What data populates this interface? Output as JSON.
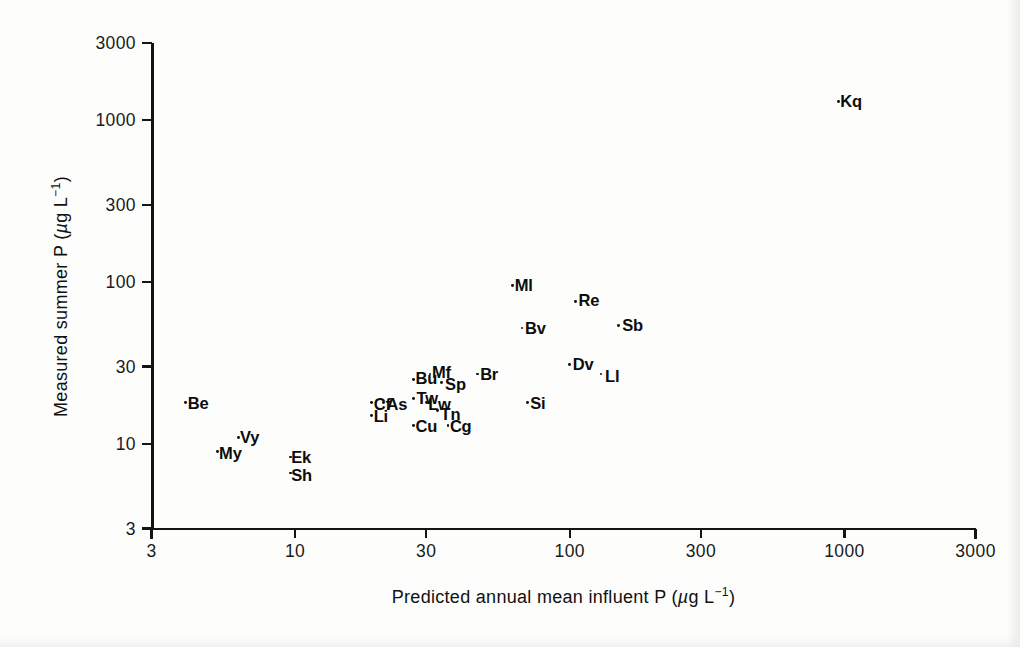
{
  "figure": {
    "background_color": "#fdfdfc",
    "ink_color": "#111111"
  },
  "chart_data": {
    "type": "scatter",
    "title": "",
    "xlabel": "Predicted annual mean influent P (µg L⁻¹)",
    "ylabel": "Measured summer P (µg L⁻¹)",
    "xscale": "log",
    "yscale": "log",
    "xlim": [
      3,
      3000
    ],
    "ylim": [
      3,
      3000
    ],
    "grid": false,
    "legend": null,
    "xticks": [
      3,
      10,
      30,
      100,
      300,
      1000,
      3000
    ],
    "xticklabels": [
      "3",
      "10",
      "30",
      "100",
      "300",
      "1000",
      "3000"
    ],
    "yticks": [
      3,
      10,
      30,
      100,
      300,
      1000,
      3000
    ],
    "yticklabels": [
      "3",
      "10",
      "30",
      "100",
      "300",
      "1000",
      "3000"
    ],
    "point_label_mode": "text-label-per-point",
    "points": [
      {
        "label": "Kq",
        "x": 950,
        "y": 1300
      },
      {
        "label": "Ml",
        "x": 62,
        "y": 95
      },
      {
        "label": "Re",
        "x": 105,
        "y": 76
      },
      {
        "label": "Bv",
        "x": 67,
        "y": 52
      },
      {
        "label": "Sb",
        "x": 150,
        "y": 54
      },
      {
        "label": "Dv",
        "x": 100,
        "y": 31
      },
      {
        "label": "Ll",
        "x": 130,
        "y": 27
      },
      {
        "label": "Br",
        "x": 46,
        "y": 27
      },
      {
        "label": "Bu",
        "x": 27,
        "y": 25
      },
      {
        "label": "Mf",
        "x": 31,
        "y": 27
      },
      {
        "label": "Sp",
        "x": 34,
        "y": 24
      },
      {
        "label": "Si",
        "x": 70,
        "y": 18
      },
      {
        "label": "Cf",
        "x": 19,
        "y": 18
      },
      {
        "label": "As",
        "x": 21,
        "y": 18
      },
      {
        "label": "Tw",
        "x": 27,
        "y": 19
      },
      {
        "label": "Lw",
        "x": 30,
        "y": 18
      },
      {
        "label": "Tn",
        "x": 33,
        "y": 16
      },
      {
        "label": "Li",
        "x": 19,
        "y": 15
      },
      {
        "label": "Be",
        "x": 4.0,
        "y": 18
      },
      {
        "label": "Cu",
        "x": 27,
        "y": 13
      },
      {
        "label": "Cg",
        "x": 36,
        "y": 13
      },
      {
        "label": "Vy",
        "x": 6.2,
        "y": 11
      },
      {
        "label": "My",
        "x": 5.2,
        "y": 9.0
      },
      {
        "label": "Ek",
        "x": 9.6,
        "y": 8.3
      },
      {
        "label": "Sh",
        "x": 9.6,
        "y": 6.6
      }
    ]
  }
}
